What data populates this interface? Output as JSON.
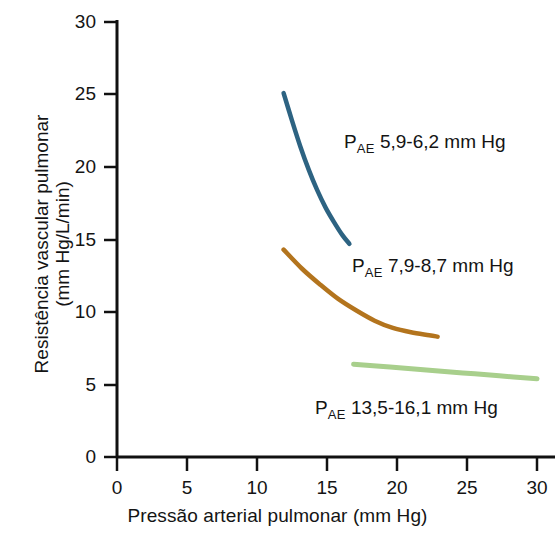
{
  "chart_data": {
    "type": "line",
    "title": "",
    "xlabel": "Pressão arterial pulmonar (mm Hg)",
    "ylabel_line1": "Resistência vascular pulmonar",
    "ylabel_line2": "(mm Hg/L/min)",
    "xlim": [
      0,
      31
    ],
    "ylim": [
      0,
      30
    ],
    "xticks": [
      0,
      5,
      10,
      15,
      20,
      25,
      30
    ],
    "xtick_labels": [
      "0",
      "5",
      "10",
      "15",
      "20",
      "25",
      "30"
    ],
    "yticks": [
      0,
      5,
      10,
      15,
      20,
      25,
      30
    ],
    "ytick_labels": [
      "0",
      "5",
      "10",
      "15",
      "20",
      "25",
      "30"
    ],
    "grid": false,
    "legend": "none (inline curve annotations)",
    "series": [
      {
        "name": "P_AE 5,9-6,2 mm Hg",
        "label_prefix": "P",
        "label_subscript": "AE",
        "label_value": "5,9-6,2 mm Hg",
        "color": "#2d6382",
        "x": [
          11.9,
          12.5,
          13.1,
          13.7,
          14.3,
          14.9,
          15.5,
          16.1,
          16.6
        ],
        "y": [
          25.1,
          23.2,
          21.4,
          19.8,
          18.4,
          17.2,
          16.2,
          15.3,
          14.7
        ]
      },
      {
        "name": "P_AE 7,9-8,7 mm Hg",
        "label_prefix": "P",
        "label_subscript": "AE",
        "label_value": "7,9-8,7 mm Hg",
        "color": "#b3741d",
        "x": [
          11.9,
          13.2,
          14.5,
          15.8,
          17.1,
          18.4,
          19.7,
          21.0,
          22.3,
          22.9
        ],
        "y": [
          14.3,
          13.0,
          11.9,
          10.9,
          10.1,
          9.4,
          8.9,
          8.6,
          8.4,
          8.3
        ]
      },
      {
        "name": "P_AE 13,5-16,1 mm Hg",
        "label_prefix": "P",
        "label_subscript": "AE",
        "label_value": "13,5-16,1 mm Hg",
        "color": "#a8cf8c",
        "x": [
          16.9,
          19.5,
          22.1,
          24.7,
          27.3,
          30.0
        ],
        "y": [
          6.4,
          6.2,
          6.0,
          5.8,
          5.6,
          5.4
        ]
      }
    ],
    "annotations": [
      {
        "text": "P",
        "sub": "AE",
        "rest": " 5,9-6,2 mm Hg",
        "x_px": 344,
        "y_px": 131
      },
      {
        "text": "P",
        "sub": "AE",
        "rest": " 7,9-8,7 mm Hg",
        "x_px": 352,
        "y_px": 255
      },
      {
        "text": "P",
        "sub": "AE",
        "rest": " 13,5-16,1 mm Hg",
        "x_px": 315,
        "y_px": 397
      }
    ]
  },
  "axis": {
    "color": "#111111"
  }
}
